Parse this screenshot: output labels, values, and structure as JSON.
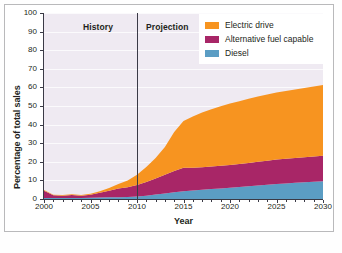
{
  "chart_data": {
    "type": "area",
    "title": "",
    "subtitle": "",
    "xlabel": "Year",
    "ylabel": "Percentage of total sales",
    "xlim": [
      2000,
      2030
    ],
    "ylim": [
      0,
      100
    ],
    "grid": true,
    "legend_position": "top-right",
    "stacked": true,
    "x": [
      2000,
      2001,
      2002,
      2003,
      2004,
      2005,
      2006,
      2007,
      2008,
      2009,
      2010,
      2011,
      2012,
      2013,
      2014,
      2015,
      2016,
      2017,
      2018,
      2019,
      2020,
      2021,
      2022,
      2023,
      2024,
      2025,
      2026,
      2027,
      2028,
      2029,
      2030
    ],
    "series": [
      {
        "name": "Diesel",
        "color": "#5b9dc4",
        "values": [
          0.5,
          0.5,
          0.5,
          0.6,
          0.6,
          0.7,
          0.8,
          0.9,
          1.0,
          1.1,
          1.3,
          1.8,
          2.4,
          3.0,
          3.6,
          4.2,
          4.6,
          5.0,
          5.4,
          5.7,
          6.0,
          6.4,
          6.8,
          7.2,
          7.6,
          8.0,
          8.4,
          8.7,
          9.0,
          9.3,
          9.6
        ]
      },
      {
        "name": "Alternative fuel capable",
        "color": "#a82667",
        "values": [
          4.0,
          1.5,
          1.3,
          1.6,
          1.2,
          1.6,
          2.5,
          3.5,
          4.6,
          5.2,
          6.2,
          7.4,
          8.6,
          10.0,
          11.4,
          12.6,
          12.2,
          12.1,
          12.1,
          12.2,
          12.3,
          12.4,
          12.6,
          12.8,
          13.0,
          13.2,
          13.3,
          13.4,
          13.5,
          13.6,
          13.7
        ]
      },
      {
        "name": "Electric drive",
        "color": "#f79420",
        "values": [
          0.3,
          0.3,
          0.3,
          0.3,
          0.3,
          0.5,
          0.9,
          1.5,
          2.4,
          3.6,
          5.5,
          8.0,
          11.0,
          15.0,
          21.0,
          25.2,
          27.6,
          29.4,
          30.8,
          32.0,
          33.0,
          33.8,
          34.5,
          35.1,
          35.6,
          36.0,
          36.4,
          36.8,
          37.2,
          37.6,
          38.0
        ]
      }
    ],
    "yticks": [
      0,
      10,
      20,
      30,
      40,
      50,
      60,
      70,
      80,
      90,
      100
    ],
    "xticks": [
      2000,
      2005,
      2010,
      2015,
      2020,
      2025,
      2030
    ],
    "annotations": [
      {
        "text": "History",
        "x": 2005,
        "type": "region-label"
      },
      {
        "text": "Projection",
        "x": 2015,
        "type": "region-label"
      },
      {
        "text": "",
        "x": 2010,
        "type": "vertical-divider"
      }
    ],
    "divider_x": 2010
  },
  "legend": {
    "items": [
      {
        "label": "Electric drive",
        "color": "#f79420"
      },
      {
        "label": "Alternative fuel capable",
        "color": "#a82667"
      },
      {
        "label": "Diesel",
        "color": "#5b9dc4"
      }
    ]
  },
  "axes": {
    "ylabel": "Percentage of total sales",
    "xlabel": "Year",
    "yticks": [
      "100",
      "90",
      "80",
      "70",
      "60",
      "50",
      "40",
      "30",
      "20",
      "10",
      "0"
    ],
    "xticks": [
      "2000",
      "2005",
      "2010",
      "2015",
      "2020",
      "2025",
      "2030"
    ]
  },
  "regions": {
    "history": "History",
    "projection": "Projection"
  },
  "colors": {
    "electric": "#f79420",
    "altfuel": "#a82667",
    "diesel": "#5b9dc4",
    "plot_background": "#efeaf2",
    "axis": "#3a3a46",
    "divider": "#3a3a46"
  }
}
